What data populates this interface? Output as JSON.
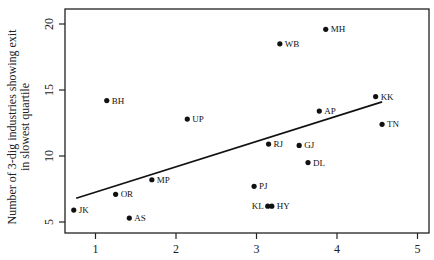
{
  "chart_data": {
    "type": "scatter",
    "title": "",
    "xlabel": "",
    "ylabel": "Number of 3-dig industries showing exit in slowest quartile",
    "ylabel_lines": [
      "Number of 3-dig industries showing exit",
      "in slowest quartile"
    ],
    "xlim": [
      0.4,
      5.1
    ],
    "ylim": [
      4.1,
      20.8
    ],
    "xticks": [
      1,
      2,
      3,
      4,
      5
    ],
    "yticks": [
      5,
      10,
      15,
      20
    ],
    "grid": false,
    "legend": null,
    "points": [
      {
        "label": "MH",
        "x": 3.86,
        "y": 19.6
      },
      {
        "label": "WB",
        "x": 3.29,
        "y": 18.5
      },
      {
        "label": "BH",
        "x": 1.14,
        "y": 14.2
      },
      {
        "label": "KK",
        "x": 4.48,
        "y": 14.5
      },
      {
        "label": "AP",
        "x": 3.78,
        "y": 13.4
      },
      {
        "label": "UP",
        "x": 2.14,
        "y": 12.8
      },
      {
        "label": "TN",
        "x": 4.56,
        "y": 12.4
      },
      {
        "label": "RJ",
        "x": 3.15,
        "y": 10.9
      },
      {
        "label": "GJ",
        "x": 3.53,
        "y": 10.8
      },
      {
        "label": "DL",
        "x": 3.64,
        "y": 9.5
      },
      {
        "label": "MP",
        "x": 1.7,
        "y": 8.2
      },
      {
        "label": "PJ",
        "x": 2.97,
        "y": 7.7
      },
      {
        "label": "OR",
        "x": 1.25,
        "y": 7.1
      },
      {
        "label": "KL",
        "x": 3.14,
        "y": 6.2
      },
      {
        "label": "HY",
        "x": 3.19,
        "y": 6.2
      },
      {
        "label": "JK",
        "x": 0.73,
        "y": 5.9
      },
      {
        "label": "AS",
        "x": 1.42,
        "y": 5.3
      }
    ],
    "fit_line": {
      "x0": 0.76,
      "y0": 6.8,
      "x1": 4.56,
      "y1": 14.1
    }
  },
  "colors": {
    "point": "#111111",
    "axis": "#222222",
    "line": "#111111",
    "background": "#ffffff"
  }
}
